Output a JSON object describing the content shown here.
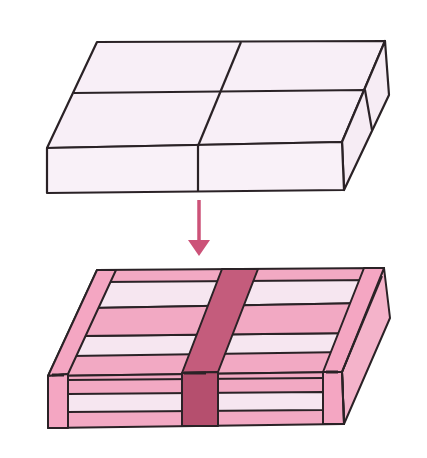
{
  "figure": {
    "top_item": {
      "name": "unwrapped block",
      "divisions": "2 x 2",
      "fill": "#f8eff7",
      "stroke": "#2a2226"
    },
    "arrow": {
      "direction": "down",
      "color": "#cc5278"
    },
    "bottom_item": {
      "name": "wrapped block with straps",
      "light_stripe": "#f6e6f0",
      "pink_stripe": "#f2a9c3",
      "side_fill": "#f4b3ca",
      "center_strap": "#c45c7c",
      "center_strap_side": "#b54f6e",
      "edge_strap": "#f4a6c2",
      "stroke": "#2a2226"
    }
  }
}
